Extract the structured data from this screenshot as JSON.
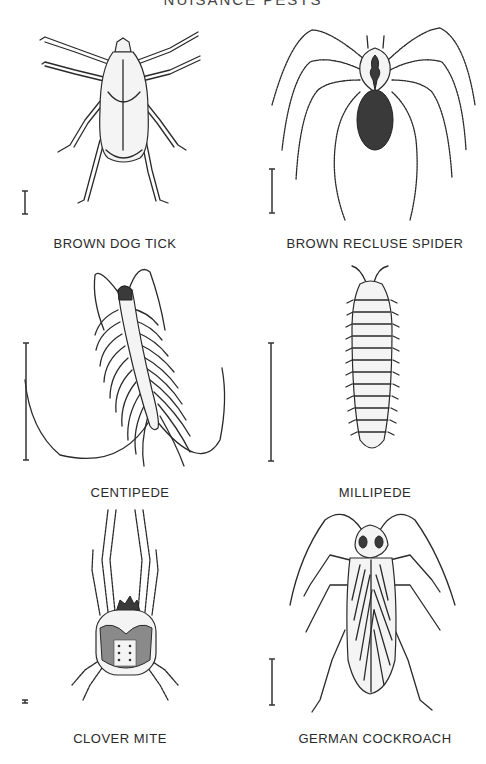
{
  "page": {
    "title": "NUISANCE PESTS"
  },
  "specimens": [
    {
      "label": "BROWN DOG TICK",
      "icon": "tick-illustration"
    },
    {
      "label": "BROWN RECLUSE SPIDER",
      "icon": "spider-illustration"
    },
    {
      "label": "CENTIPEDE",
      "icon": "centipede-illustration"
    },
    {
      "label": "MILLIPEDE",
      "icon": "millipede-illustration"
    },
    {
      "label": "CLOVER MITE",
      "icon": "mite-illustration"
    },
    {
      "label": "GERMAN COCKROACH",
      "icon": "cockroach-illustration"
    }
  ],
  "colors": {
    "ink": "#2a2a2a",
    "background": "#ffffff"
  }
}
